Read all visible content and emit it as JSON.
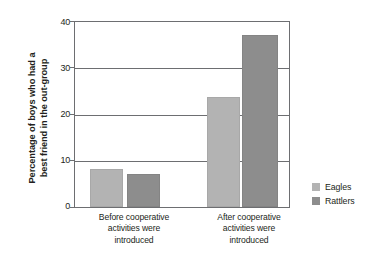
{
  "chart_data": {
    "type": "bar",
    "title": "",
    "xlabel": "",
    "ylabel_line1": "Percentage of boys who had a",
    "ylabel_line2": "best friend in the out-group",
    "categories": [
      "Before cooperative activities were introduced",
      "After cooperative activities were introduced"
    ],
    "category_lines": [
      [
        "Before cooperative",
        "activities were",
        "introduced"
      ],
      [
        "After cooperative",
        "activities were",
        "introduced"
      ]
    ],
    "series": [
      {
        "name": "Eagles",
        "color": "#b3b3b3",
        "values": [
          7.8,
          23.4
        ]
      },
      {
        "name": "Rattlers",
        "color": "#8d8d8d",
        "values": [
          6.7,
          36.8
        ]
      }
    ],
    "ylim": [
      0,
      40
    ],
    "yticks": [
      0,
      10,
      20,
      30,
      40
    ],
    "ytick_labels": [
      "0",
      "10",
      "20",
      "30",
      "40"
    ],
    "grid": true,
    "legend_position": "right"
  },
  "legend": {
    "entries": [
      {
        "label": "Eagles",
        "color": "#b3b3b3"
      },
      {
        "label": "Rattlers",
        "color": "#8d8d8d"
      }
    ]
  }
}
